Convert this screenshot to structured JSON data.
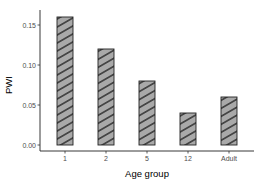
{
  "chart_data": {
    "type": "bar",
    "title": "",
    "xlabel": "Age group",
    "ylabel": "PWI",
    "categories": [
      "1",
      "2",
      "5",
      "12",
      "Adult"
    ],
    "values": [
      0.16,
      0.12,
      0.08,
      0.04,
      0.06
    ],
    "ylim": [
      0,
      0.16
    ],
    "yticks": [
      "0.00",
      "0.05",
      "0.10",
      "0.15"
    ],
    "grid": false,
    "legend": null,
    "bar_fill": "#a9a9a9",
    "bar_pattern": "diagonal-stripes",
    "bar_border": "#222222"
  }
}
